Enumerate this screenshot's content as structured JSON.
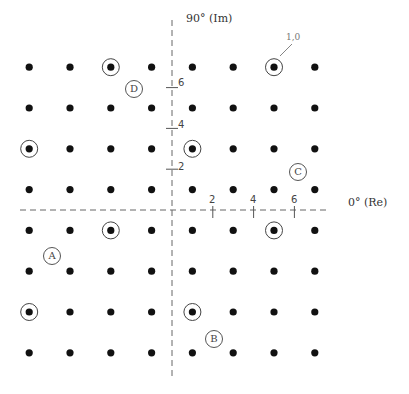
{
  "axes": {
    "y_label": "90° (Im)",
    "x_label": "0° (Re)",
    "x_ticks": [
      "2",
      "4",
      "6"
    ],
    "y_ticks": [
      "6",
      "4",
      "2"
    ]
  },
  "constellation": {
    "type": "64-QAM",
    "grid_values": [
      -7,
      -5,
      -3,
      -1,
      1,
      3,
      5,
      7
    ],
    "circled_points": [
      {
        "i": -3,
        "q": 7
      },
      {
        "i": 5,
        "q": 7,
        "label": "1,0"
      },
      {
        "i": -7,
        "q": 3
      },
      {
        "i": 1,
        "q": 3
      },
      {
        "i": -3,
        "q": -1
      },
      {
        "i": 5,
        "q": -1
      },
      {
        "i": -7,
        "q": -5
      },
      {
        "i": 1,
        "q": -5
      }
    ]
  },
  "region_labels": [
    {
      "text": "A",
      "x": 51,
      "y": 255
    },
    {
      "text": "B",
      "x": 213,
      "y": 338
    },
    {
      "text": "C",
      "x": 297,
      "y": 171
    },
    {
      "text": "D",
      "x": 133,
      "y": 88
    }
  ],
  "point_label": "1,0",
  "colors": {
    "dot": "#111111",
    "axis": "#555555",
    "circle": "#444444"
  }
}
